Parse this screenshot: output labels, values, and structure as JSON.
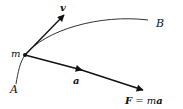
{
  "diagram": {
    "title": "",
    "labels": {
      "point_mass": "m",
      "velocity": "v",
      "acceleration": "a",
      "start_point": "A",
      "end_point": "B",
      "force_F": "F",
      "force_eq": " = m",
      "force_a": "a"
    },
    "colors": {
      "stroke": "#111111",
      "curve": "#333333",
      "background": "#ffffff"
    }
  }
}
